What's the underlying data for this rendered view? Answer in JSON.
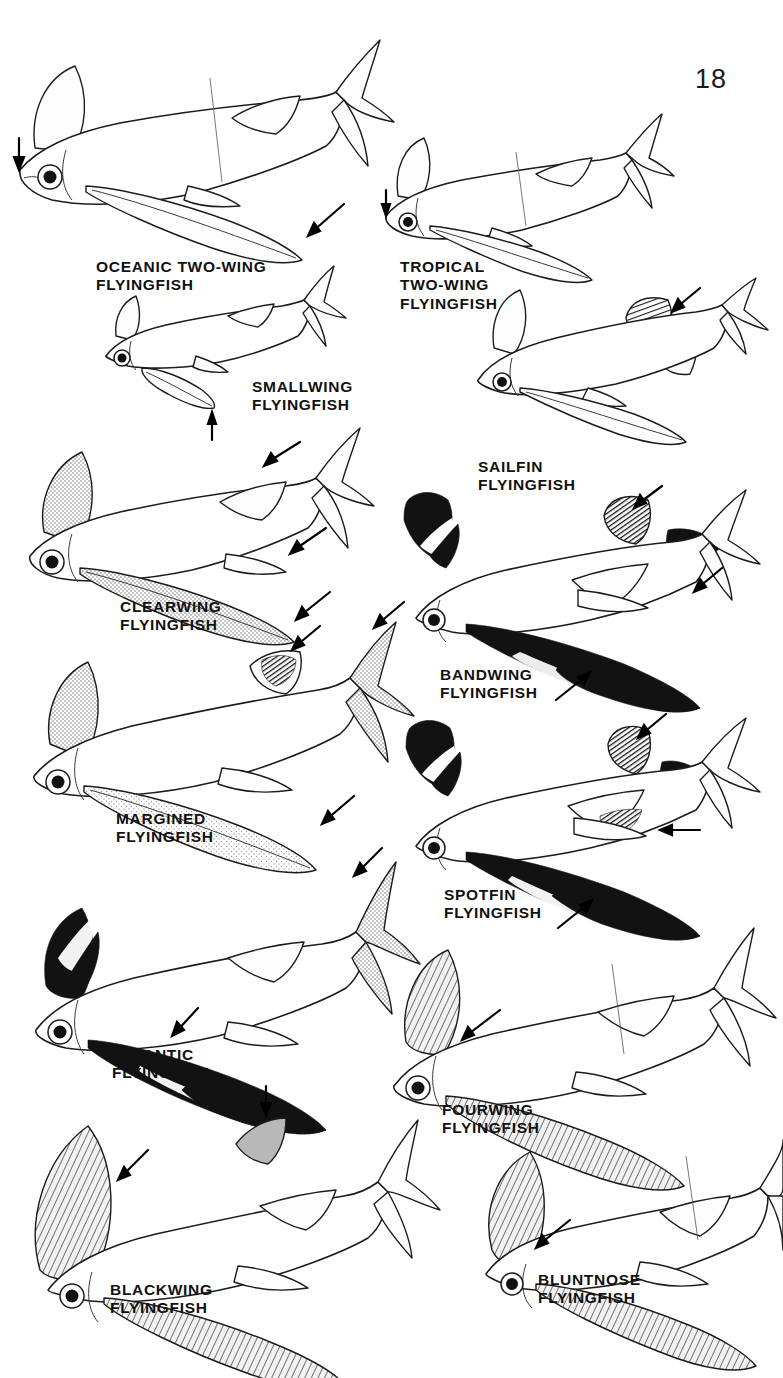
{
  "page": {
    "number": "18",
    "background_color": "#ffffff",
    "ink_color": "#111111",
    "width": 783,
    "height": 1378,
    "kind": "field-guide illustration plate"
  },
  "species": [
    {
      "id": "oceanic-two-wing",
      "name_lines": [
        "OCEANIC TWO-WING",
        "FLYINGFISH"
      ],
      "label_text": "OCEANIC TWO-WING\nFLYINGFISH",
      "label_x": 96,
      "label_y": 258,
      "label_align": "left",
      "column": "left",
      "row": 1,
      "arrows": 2,
      "arrow_targets": [
        "snout",
        "pectoral-fin-tip"
      ],
      "pectoral_shade": "clear",
      "dorsal_shade": "clear"
    },
    {
      "id": "tropical-two-wing",
      "name_lines": [
        "TROPICAL",
        "TWO-WING",
        "FLYINGFISH"
      ],
      "label_text": "TROPICAL\nTWO-WING\nFLYINGFISH",
      "label_x": 400,
      "label_y": 258,
      "label_align": "left",
      "column": "right",
      "row": 1,
      "arrows": 1,
      "arrow_targets": [
        "snout"
      ],
      "pectoral_shade": "clear",
      "dorsal_shade": "clear"
    },
    {
      "id": "smallwing",
      "name_lines": [
        "SMALLWING",
        "FLYINGFISH"
      ],
      "label_text": "SMALLWING\nFLYINGFISH",
      "label_x": 252,
      "label_y": 378,
      "label_align": "left",
      "column": "left",
      "row": 2,
      "arrows": 1,
      "arrow_targets": [
        "short-pectoral-fin"
      ],
      "pectoral_shade": "clear",
      "dorsal_shade": "clear"
    },
    {
      "id": "sailfin",
      "name_lines": [
        "SAILFIN",
        "FLYINGFISH"
      ],
      "label_text": "SAILFIN\nFLYINGFISH",
      "label_x": 478,
      "label_y": 458,
      "label_align": "left",
      "column": "right",
      "row": 2,
      "arrows": 1,
      "arrow_targets": [
        "tall-dark-dorsal-fin"
      ],
      "pectoral_shade": "clear",
      "dorsal_shade": "dark"
    },
    {
      "id": "clearwing",
      "name_lines": [
        "CLEARWING",
        "FLYINGFISH"
      ],
      "label_text": "CLEARWING\nFLYINGFISH",
      "label_x": 120,
      "label_y": 598,
      "label_align": "left",
      "column": "left",
      "row": 3,
      "arrows": 3,
      "arrow_targets": [
        "dorsal-fin",
        "pelvic-fin",
        "pectoral-fin-tip"
      ],
      "pectoral_shade": "stippled",
      "dorsal_shade": "stippled"
    },
    {
      "id": "bandwing",
      "name_lines": [
        "BANDWING",
        "FLYINGFISH"
      ],
      "label_text": "BANDWING\nFLYINGFISH",
      "label_x": 440,
      "label_y": 666,
      "label_align": "left",
      "column": "right",
      "row": 3,
      "arrows": 3,
      "arrow_targets": [
        "dark-dorsal-fin",
        "dark-caudal-lobe",
        "pale-band-on-pectoral"
      ],
      "pectoral_shade": "black-with-pale-band",
      "dorsal_shade": "black"
    },
    {
      "id": "margined",
      "name_lines": [
        "MARGINED",
        "FLYINGFISH"
      ],
      "label_text": "MARGINED\nFLYINGFISH",
      "label_x": 116,
      "label_y": 810,
      "label_align": "left",
      "column": "left",
      "row": 4,
      "arrows": 3,
      "arrow_targets": [
        "dark-spot-on-dorsal-fin",
        "caudal-fin",
        "pectoral-fin-margin"
      ],
      "pectoral_shade": "stippled-with-pale-margin",
      "dorsal_shade": "dark-spot"
    },
    {
      "id": "spotfin",
      "name_lines": [
        "SPOTFIN",
        "FLYINGFISH"
      ],
      "label_text": "SPOTFIN\nFLYINGFISH",
      "label_x": 444,
      "label_y": 886,
      "label_align": "left",
      "column": "right",
      "row": 4,
      "arrows": 3,
      "arrow_targets": [
        "dorsal-fin-spot",
        "dark-blotch-on-pelvic",
        "pale-band-on-pectoral"
      ],
      "pectoral_shade": "black-with-pale-band",
      "dorsal_shade": "dark-spot"
    },
    {
      "id": "atlantic",
      "name_lines": [
        "ATLANTIC",
        "FLYINGFISH"
      ],
      "label_text": "ATLANTIC\nFLYINGFISH",
      "label_x": 112,
      "label_y": 1046,
      "label_align": "left",
      "column": "left",
      "row": 5,
      "arrows": 2,
      "arrow_targets": [
        "caudal-fin",
        "pale-stripe-on-pectoral"
      ],
      "pectoral_shade": "black-with-pale-stripe",
      "dorsal_shade": "clear"
    },
    {
      "id": "fourwing",
      "name_lines": [
        "FOURWING",
        "FLYINGFISH"
      ],
      "label_text": "FOURWING\nFLYINGFISH",
      "label_x": 442,
      "label_y": 1101,
      "label_align": "left",
      "column": "right",
      "row": 5,
      "arrows": 1,
      "arrow_targets": [
        "shaded-pelvic-fin"
      ],
      "pectoral_shade": "stippled",
      "dorsal_shade": "clear"
    },
    {
      "id": "blackwing",
      "name_lines": [
        "BLACKWING",
        "FLYINGFISH"
      ],
      "label_text": "BLACKWING\nFLYINGFISH",
      "label_x": 110,
      "label_y": 1281,
      "label_align": "left",
      "column": "left",
      "row": 6,
      "arrows": 2,
      "arrow_targets": [
        "dorsal-fin",
        "dark-pelvic-fin"
      ],
      "pectoral_shade": "dark-hatched",
      "dorsal_shade": "shaded"
    },
    {
      "id": "bluntnose",
      "name_lines": [
        "BLUNTNOSE",
        "FLYINGFISH"
      ],
      "label_text": "BLUNTNOSE\nFLYINGFISH",
      "label_x": 538,
      "label_y": 1271,
      "label_align": "left",
      "column": "right",
      "row": 6,
      "arrows": 1,
      "arrow_targets": [
        "pelvic-fin"
      ],
      "pectoral_shade": "stippled",
      "dorsal_shade": "clear"
    }
  ]
}
